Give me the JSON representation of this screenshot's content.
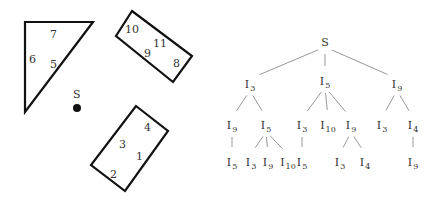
{
  "obstacles": {
    "start_label": "S",
    "triangle": {
      "points": [
        [
          25,
          22
        ],
        [
          93,
          22
        ],
        [
          25,
          112
        ]
      ],
      "labels": [
        {
          "t": "7",
          "x": 50,
          "y": 38
        },
        {
          "t": "6",
          "x": 29,
          "y": 63
        },
        {
          "t": "5",
          "x": 50,
          "y": 68
        }
      ]
    },
    "rect_top": {
      "points": [
        [
          132,
          11
        ],
        [
          192,
          56
        ],
        [
          173,
          82
        ],
        [
          116,
          36
        ]
      ],
      "labels": [
        {
          "t": "10",
          "x": 125,
          "y": 33
        },
        {
          "t": "11",
          "x": 153,
          "y": 47
        },
        {
          "t": "9",
          "x": 144,
          "y": 57
        },
        {
          "t": "8",
          "x": 173,
          "y": 67
        }
      ]
    },
    "rect_bottom": {
      "points": [
        [
          136,
          106
        ],
        [
          168,
          131
        ],
        [
          125,
          191
        ],
        [
          91,
          165
        ]
      ],
      "labels": [
        {
          "t": "4",
          "x": 144,
          "y": 131
        },
        {
          "t": "3",
          "x": 119,
          "y": 148
        },
        {
          "t": "1",
          "x": 136,
          "y": 160
        },
        {
          "t": "2",
          "x": 110,
          "y": 178
        }
      ]
    },
    "start_point": {
      "x": 77,
      "y": 108
    }
  },
  "tree": {
    "root": "S",
    "nodes": [
      {
        "id": "S",
        "base": "S",
        "sub": "",
        "x": 325,
        "y": 42
      },
      {
        "id": "a",
        "base": "I",
        "sub": "3",
        "x": 250,
        "y": 84
      },
      {
        "id": "b",
        "base": "I",
        "sub": "5",
        "x": 325,
        "y": 81
      },
      {
        "id": "c",
        "base": "I",
        "sub": "9",
        "x": 397,
        "y": 84
      },
      {
        "id": "a1",
        "base": "I",
        "sub": "9",
        "x": 232,
        "y": 125
      },
      {
        "id": "a2",
        "base": "I",
        "sub": "5",
        "x": 266,
        "y": 125
      },
      {
        "id": "b1",
        "base": "I",
        "sub": "3",
        "x": 302,
        "y": 125
      },
      {
        "id": "b2",
        "base": "I",
        "sub": "10",
        "x": 328,
        "y": 125
      },
      {
        "id": "b3",
        "base": "I",
        "sub": "9",
        "x": 351,
        "y": 125
      },
      {
        "id": "c1",
        "base": "I",
        "sub": "3",
        "x": 382,
        "y": 125
      },
      {
        "id": "c2",
        "base": "I",
        "sub": "4",
        "x": 413,
        "y": 125
      },
      {
        "id": "a1a",
        "base": "I",
        "sub": "5",
        "x": 232,
        "y": 162
      },
      {
        "id": "a2a",
        "base": "I",
        "sub": "3",
        "x": 251,
        "y": 162
      },
      {
        "id": "a2b",
        "base": "I",
        "sub": "9",
        "x": 268,
        "y": 162
      },
      {
        "id": "a2c",
        "base": "I",
        "sub": "10",
        "x": 288,
        "y": 162
      },
      {
        "id": "b1a",
        "base": "I",
        "sub": "5",
        "x": 302,
        "y": 162
      },
      {
        "id": "b3a",
        "base": "I",
        "sub": "3",
        "x": 340,
        "y": 162
      },
      {
        "id": "b3b",
        "base": "I",
        "sub": "4",
        "x": 365,
        "y": 162
      },
      {
        "id": "c2a",
        "base": "I",
        "sub": "9",
        "x": 413,
        "y": 162
      }
    ],
    "edges": [
      [
        "S",
        "a"
      ],
      [
        "S",
        "b"
      ],
      [
        "S",
        "c"
      ],
      [
        "a",
        "a1"
      ],
      [
        "a",
        "a2"
      ],
      [
        "b",
        "b1"
      ],
      [
        "b",
        "b2"
      ],
      [
        "b",
        "b3"
      ],
      [
        "c",
        "c1"
      ],
      [
        "c",
        "c2"
      ],
      [
        "a1",
        "a1a"
      ],
      [
        "a2",
        "a2a"
      ],
      [
        "a2",
        "a2b"
      ],
      [
        "a2",
        "a2c"
      ],
      [
        "b1",
        "b1a"
      ],
      [
        "b3",
        "b3a"
      ],
      [
        "b3",
        "b3b"
      ],
      [
        "c2",
        "c2a"
      ]
    ]
  }
}
